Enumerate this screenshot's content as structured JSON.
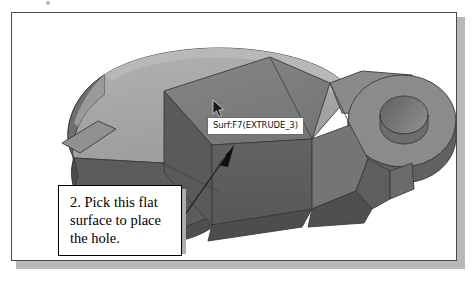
{
  "figure": {
    "kind": "cad-3d-model-view",
    "background_color": "#ffffff",
    "frame_border_color": "#4a4a4a",
    "shadow_color": "#b9b9b5"
  },
  "tooltip": {
    "label": "Surf:F7(EXTRUDE_3)",
    "background_color": "#ffffff",
    "border_color": "#6d6d6d",
    "text_color": "#151515"
  },
  "callout": {
    "line1": "2. Pick this flat",
    "line2": "surface to place",
    "line3": "the hole.",
    "full_text": "2. Pick this flat surface to place the hole.",
    "step_number": "2.",
    "border_color": "#000000",
    "background_color": "#ffffff",
    "text_color": "#000000"
  },
  "cursor": {
    "name": "arrow-pointer",
    "x": 207,
    "y": 96
  },
  "leader": {
    "name": "callout-leader-arrow",
    "from_x": 172,
    "from_y": 207,
    "to_x": 222,
    "to_y": 136,
    "color": "#101010"
  },
  "model": {
    "name": "solid-part",
    "shading": {
      "top_light": "#a9a9a9",
      "top_mid": "#8e8e8e",
      "top_face": "#7c7c7c",
      "front_dark": "#5d5d5d",
      "side_dark": "#6a6a6a",
      "deep_shadow": "#4f4f4f",
      "edge": "#3a3a3a",
      "hole_inner": "#6f6f6f",
      "hole_floor": "#9c9c9c"
    },
    "features": [
      {
        "name": "large-rounded-base-plate"
      },
      {
        "name": "center-rectangular-boss"
      },
      {
        "name": "right-circular-boss"
      },
      {
        "name": "through-hole"
      },
      {
        "name": "right-notch"
      }
    ]
  }
}
